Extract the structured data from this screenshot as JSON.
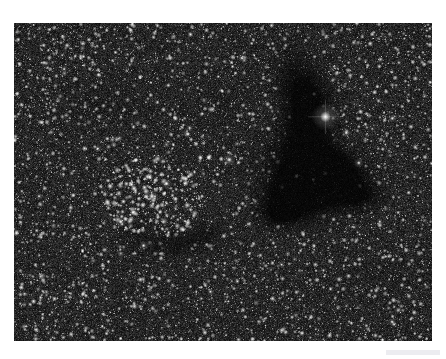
{
  "page": {
    "background_color": "#ffffff",
    "width": 446,
    "height": 359
  },
  "header": {
    "text": "",
    "color": "#e9e9ee"
  },
  "photo": {
    "caption": "",
    "x": 14,
    "y": 23,
    "width": 418,
    "height": 318,
    "background_color": "#0a0a0a",
    "star_color": "#ffffff",
    "nebula_color": "#000000",
    "subject": "dense-star-field-with-open-cluster-and-dark-nebula",
    "features": [
      {
        "name": "open-star-cluster",
        "cx": 0.33,
        "cy": 0.55
      },
      {
        "name": "dark-nebula",
        "cx": 0.7,
        "cy": 0.48
      },
      {
        "name": "bright-star",
        "cx": 0.745,
        "cy": 0.295
      }
    ]
  },
  "footer": {
    "bar_color": "#ececf0",
    "label": ""
  },
  "render_seed": 20240517
}
